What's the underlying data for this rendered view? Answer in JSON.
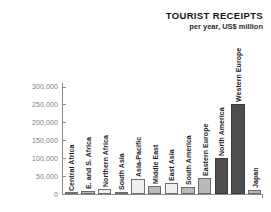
{
  "chart_data": {
    "type": "bar",
    "title": "TOURIST RECEIPTS",
    "subtitle": "per year, US$ million",
    "xlabel": "",
    "ylabel": "",
    "ylim": [
      0,
      310000
    ],
    "grid": false,
    "legend": "none",
    "ytick_labels": [
      "300,000",
      "250,000",
      "200,000",
      "150,000",
      "100,000",
      "50,000",
      "0"
    ],
    "ytick_values": [
      300000,
      250000,
      200000,
      150000,
      100000,
      50000,
      0
    ],
    "categories": [
      "Central Africa",
      "E. and S. Africa",
      "Northern Africa",
      "South Asia",
      "Asia-Pacific",
      "Middle East",
      "East Asia",
      "South America",
      "Eastern Europe",
      "North America",
      "Western Europe",
      "Japan"
    ],
    "values": [
      2000,
      9000,
      13000,
      5000,
      42000,
      22000,
      30000,
      20000,
      45000,
      100000,
      250000,
      10000
    ],
    "bar_styles": [
      "light",
      "mid",
      "light",
      "mid",
      "light",
      "mid",
      "light",
      "mid",
      "mid",
      "dark",
      "dark",
      "mid"
    ]
  },
  "colors": {
    "axis": "#8a8a8a",
    "tick_text": "#7d7d7d",
    "title_text": "#141414",
    "bar_light": "#efefef",
    "bar_mid": "#b9b9b9",
    "bar_dark": "#4e4e4e",
    "background": "#ffffff"
  }
}
